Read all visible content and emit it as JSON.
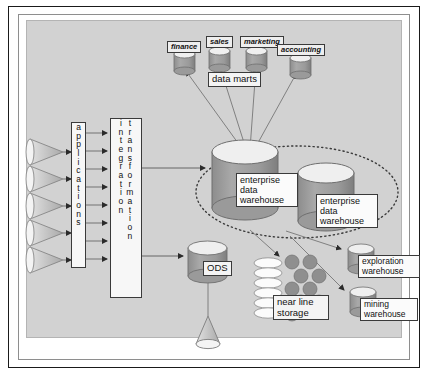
{
  "diagram": {
    "background_color": "#d2d2d2",
    "frame_color": "#1a1a1a",
    "cylinder_fill": "#9a9a9a",
    "cylinder_top": "#efefef"
  },
  "sources": {
    "cone_count": 5,
    "feed_arrow_count": 8
  },
  "applications": {
    "label": "applications",
    "letters": [
      "a",
      "p",
      "p",
      "l",
      "i",
      "c",
      "a",
      "t",
      "i",
      "o",
      "n",
      "s"
    ]
  },
  "integration": {
    "label": "integration",
    "letters": [
      "i",
      "n",
      "t",
      "e",
      "g",
      "r",
      "a",
      "t",
      "i",
      "o",
      "n"
    ]
  },
  "transformation": {
    "label": "transformation",
    "letters": [
      "t",
      "r",
      "a",
      "n",
      "s",
      "f",
      "o",
      "r",
      "m",
      "a",
      "t",
      "i",
      "o",
      "n"
    ]
  },
  "data_marts": {
    "group_label": "data marts",
    "items": [
      {
        "label": "finance"
      },
      {
        "label": "sales"
      },
      {
        "label": "marketing"
      },
      {
        "label": "accounting"
      }
    ]
  },
  "enterprise_data_warehouse": {
    "boundary": "dotted-ellipse",
    "items": [
      {
        "label": "enterprise\ndata\nwarehouse"
      },
      {
        "label": "enterprise\ndata\nwarehouse"
      }
    ]
  },
  "ods": {
    "label": "ODS"
  },
  "near_line_storage": {
    "label": "near line\nstorage",
    "disc_count": 6,
    "platter_count": 9
  },
  "exploration_warehouse": {
    "label": "exploration\nwarehouse"
  },
  "mining_warehouse": {
    "label": "mining\nwarehouse"
  },
  "output_cone": {
    "name": "output-cone"
  }
}
